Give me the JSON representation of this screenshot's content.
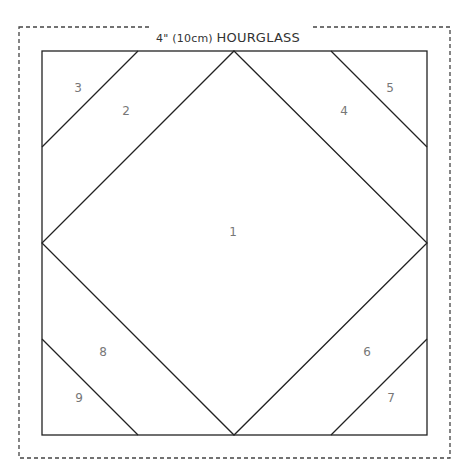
{
  "diagram": {
    "title_prefix": "4\" (10cm) ",
    "title_main": "HOURGLASS",
    "pieces": [
      {
        "label": "1",
        "x": 233,
        "y": 232
      },
      {
        "label": "2",
        "x": 126,
        "y": 111
      },
      {
        "label": "3",
        "x": 78,
        "y": 88
      },
      {
        "label": "4",
        "x": 344,
        "y": 111
      },
      {
        "label": "5",
        "x": 390,
        "y": 88
      },
      {
        "label": "6",
        "x": 367,
        "y": 352
      },
      {
        "label": "7",
        "x": 391,
        "y": 398
      },
      {
        "label": "8",
        "x": 103,
        "y": 352
      },
      {
        "label": "9",
        "x": 79,
        "y": 398
      }
    ],
    "colors": {
      "line": "#222222",
      "dash": "#444444",
      "label": "#777777"
    }
  }
}
